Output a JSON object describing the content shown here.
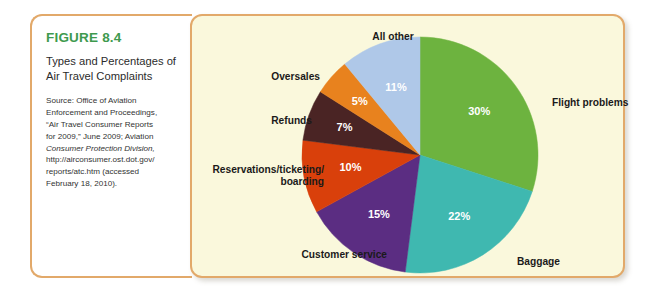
{
  "figure": {
    "number": "FIGURE 8.4",
    "title": "Types and Percentages of Air Travel Complaints",
    "source_lines": [
      "Source: Office of Aviation",
      "Enforcement and Proceedings,",
      "“Air Travel Consumer Reports",
      "for 2009,” June 2009; Aviation",
      "Consumer Protection Division,",
      "http://airconsumer.ost.dot.gov/",
      "reports/atc.htm (accessed",
      "February 18, 2010)."
    ],
    "source_italic_line_index": 4
  },
  "colors": {
    "panel_border": "#E2A96A",
    "chart_background": "#FAF8DC",
    "figure_number": "#3E9A4E",
    "label_text": "#1A1A1A",
    "value_text": "#FFFFFF"
  },
  "chart_data": {
    "type": "pie",
    "title": "Types and Percentages of Air Travel Complaints",
    "xlabel": "",
    "ylabel": "",
    "legend_position": "none",
    "grid": false,
    "unit": "%",
    "start_angle_deg": 0,
    "direction": "clockwise",
    "categories": [
      "Flight problems",
      "Baggage",
      "Customer service",
      "Reservations/ticketing/ boarding",
      "Refunds",
      "Oversales",
      "All other"
    ],
    "values": [
      30,
      22,
      15,
      10,
      7,
      5,
      11
    ],
    "value_labels": [
      "30%",
      "22%",
      "15%",
      "10%",
      "7%",
      "5%",
      "11%"
    ],
    "slice_colors": [
      "#6DB33F",
      "#3FB8B0",
      "#5B2D82",
      "#D9400B",
      "#4A2424",
      "#E8821E",
      "#AFC8E8"
    ],
    "slices": [
      {
        "label": "Flight problems",
        "label_line1": "Flight problems",
        "label_line2": "",
        "value": 30,
        "value_label": "30%",
        "color": "#6DB33F"
      },
      {
        "label": "Baggage",
        "label_line1": "Baggage",
        "label_line2": "",
        "value": 22,
        "value_label": "22%",
        "color": "#3FB8B0"
      },
      {
        "label": "Customer service",
        "label_line1": "Customer service",
        "label_line2": "",
        "value": 15,
        "value_label": "15%",
        "color": "#5B2D82"
      },
      {
        "label": "Reservations/ticketing/boarding",
        "label_line1": "Reservations/ticketing/",
        "label_line2": "boarding",
        "value": 10,
        "value_label": "10%",
        "color": "#D9400B"
      },
      {
        "label": "Refunds",
        "label_line1": "Refunds",
        "label_line2": "",
        "value": 7,
        "value_label": "7%",
        "color": "#4A2424"
      },
      {
        "label": "Oversales",
        "label_line1": "Oversales",
        "label_line2": "",
        "value": 5,
        "value_label": "5%",
        "color": "#E8821E"
      },
      {
        "label": "All other",
        "label_line1": "All other",
        "label_line2": "",
        "value": 11,
        "value_label": "11%",
        "color": "#AFC8E8"
      }
    ]
  }
}
